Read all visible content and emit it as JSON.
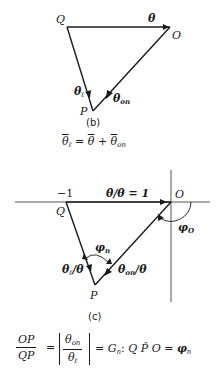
{
  "figure_b": {
    "caption": "(b)",
    "vertices": {
      "Q": "Q",
      "O": "O",
      "P": "P"
    },
    "vectors": {
      "QO": {
        "symbol": "θ",
        "sub": ""
      },
      "QP": {
        "symbol": "θ",
        "sub": "ℓ"
      },
      "OP": {
        "symbol": "θ",
        "sub": "on"
      }
    },
    "equation": {
      "lhs_symbol": "θ",
      "lhs_sub": "ℓ",
      "equals": "=",
      "term1": "θ",
      "plus": "+",
      "term2_symbol": "θ",
      "term2_sub": "on"
    }
  },
  "figure_c": {
    "caption": "(c)",
    "axis_tick": "−1",
    "vertices": {
      "Q": "Q",
      "O": "O",
      "P": "P"
    },
    "vectors": {
      "QO": {
        "label": "θ/θ = 1"
      },
      "QP": {
        "symbol": "θ",
        "sub": "ℓ",
        "suffix": "/θ"
      },
      "OP": {
        "symbol": "θ",
        "sub": "on",
        "suffix": "/θ"
      }
    },
    "angles": {
      "phi_n": {
        "symbol": "φ",
        "sub": "n"
      },
      "phi_0": {
        "symbol": "φ",
        "sub": "O"
      }
    }
  },
  "formula": {
    "ratio_num": "OP",
    "ratio_den": "QP",
    "equals1": "=",
    "abs_num_symbol": "θ",
    "abs_num_sub": "on",
    "abs_den_symbol": "θ",
    "abs_den_sub": "ℓ",
    "gain_text": "= G",
    "gain_sub": "n",
    "colon": ":",
    "angle_text": "Q P̂ O",
    "equals2": "=",
    "phi_symbol": "φ",
    "phi_sub": "n"
  }
}
